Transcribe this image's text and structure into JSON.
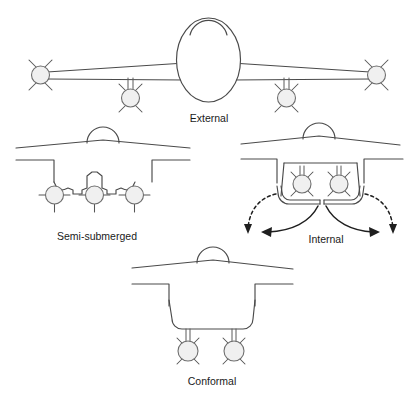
{
  "figure": {
    "background_color": "#ffffff",
    "line_color": "#4a4a4a",
    "store_fill_color": "#f0f0f0",
    "arrow_color": "#1f1f1f",
    "label_color": "#1a1a1a"
  },
  "panels": [
    {
      "id": "external",
      "label": "External",
      "view": "plan-view",
      "description": "Top view of aircraft with stores carried externally on wingtips and under-wing pylons",
      "store_count": 4,
      "store_positions": [
        "left-wingtip",
        "left-underwing-pylon",
        "right-underwing-pylon",
        "right-wingtip"
      ]
    },
    {
      "id": "semi-submerged",
      "label": "Semi-submerged",
      "view": "front-cross-section",
      "description": "Fuselage cross-section with three stores partially recessed into the lower fuselage contour",
      "store_count": 3
    },
    {
      "id": "internal",
      "label": "Internal",
      "view": "front-cross-section",
      "description": "Fuselage cross-section with two stores enclosed in a weapons bay with outward-opening doors",
      "store_count": 2,
      "door_count": 2,
      "annotation": "curved arrows indicating bay doors swinging open outward"
    },
    {
      "id": "conformal",
      "label": "Conformal",
      "view": "front-cross-section",
      "description": "Fuselage cross-section with a conformal pack carrying two stores on short pylons beneath",
      "store_count": 2
    }
  ]
}
